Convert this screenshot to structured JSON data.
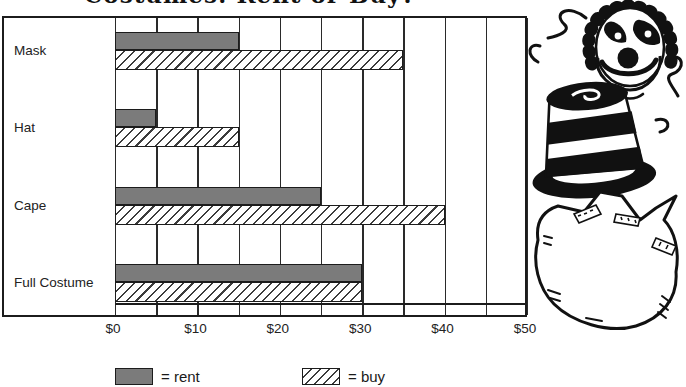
{
  "title": "Costumes: Rent or Buy?",
  "chart_data": {
    "type": "bar",
    "orientation": "horizontal",
    "title": "Costumes: Rent or Buy?",
    "categories": [
      "Mask",
      "Hat",
      "Cape",
      "Full Costume"
    ],
    "series": [
      {
        "name": "rent",
        "values": [
          15,
          5,
          25,
          30
        ],
        "style": "solid-gray"
      },
      {
        "name": "buy",
        "values": [
          35,
          15,
          40,
          30
        ],
        "style": "diagonal-hatch"
      }
    ],
    "x_ticks": [
      "$0",
      "$10",
      "$20",
      "$30",
      "$40",
      "$50"
    ],
    "x_tick_values": [
      0,
      10,
      20,
      30,
      40,
      50
    ],
    "xlim": [
      0,
      50
    ],
    "gridline_interval": 5,
    "grid": "vertical-only",
    "legend_position": "bottom"
  },
  "legend": {
    "rent_label": "= rent",
    "buy_label": "= buy"
  },
  "illustration": {
    "name": "clown-with-striped-top-hat-and-cape",
    "style": "black-and-white line art"
  },
  "colors": {
    "rent_fill": "#7b7b7b",
    "bar_border": "#1c1c1c",
    "grid_line": "#2a2a2a",
    "background": "#ffffff",
    "text": "#1a1a1a"
  }
}
